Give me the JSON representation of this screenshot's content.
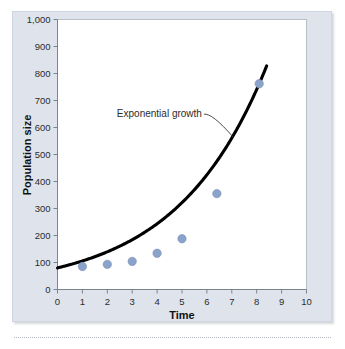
{
  "chart_data": {
    "type": "line",
    "title": "",
    "xlabel": "Time",
    "ylabel": "Population size",
    "xlim": [
      0,
      10
    ],
    "ylim": [
      0,
      1000
    ],
    "grid": false,
    "legend": "none",
    "x_ticks": [
      "0",
      "1",
      "2",
      "3",
      "4",
      "5",
      "6",
      "7",
      "8",
      "9",
      "10"
    ],
    "x_tick_values": [
      0,
      1,
      2,
      3,
      4,
      5,
      6,
      7,
      8,
      9,
      10
    ],
    "y_ticks": [
      "0",
      "100",
      "200",
      "300",
      "400",
      "500",
      "600",
      "700",
      "800",
      "900",
      "1,000"
    ],
    "y_tick_values": [
      0,
      100,
      200,
      300,
      400,
      500,
      600,
      700,
      800,
      900,
      1000
    ],
    "series": [
      {
        "name": "Exponential growth",
        "color": "#000000",
        "marker_color": "#8ba2ca",
        "curve_start": {
          "x": 0,
          "y": 80
        },
        "curve_end": {
          "x": 8.4,
          "y": 960
        },
        "x": [
          1,
          2,
          3,
          4,
          5,
          6.4,
          8.1
        ],
        "values": [
          85,
          93,
          104,
          134,
          188,
          355,
          762
        ],
        "points": [
          {
            "x": 1,
            "y": 85
          },
          {
            "x": 2,
            "y": 93
          },
          {
            "x": 3,
            "y": 104
          },
          {
            "x": 4,
            "y": 134
          },
          {
            "x": 5,
            "y": 188
          },
          {
            "x": 6.4,
            "y": 355
          },
          {
            "x": 8.1,
            "y": 762
          }
        ]
      }
    ],
    "annotations": [
      {
        "text": "Exponential growth",
        "x": 5.8,
        "y": 640,
        "leader_to": {
          "x": 7.05,
          "y": 565
        }
      }
    ]
  },
  "style": {
    "panel_background": "#dfe4ec",
    "plot_background": "#ffffff",
    "axis_color": "#7d838c",
    "curve_color": "#000000",
    "marker_color": "#8ba2ca",
    "text_color": "#2b2b2b"
  }
}
